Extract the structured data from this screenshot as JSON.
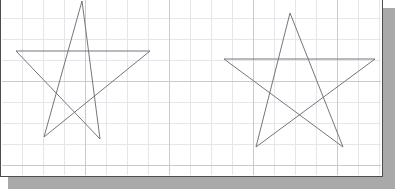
{
  "app": {
    "surface_name": "drawing-canvas",
    "background_color": "#ffffff",
    "frame_border_color": "#4d4d4d",
    "shadow_color": "#a9a9a9",
    "canvas_width": 383,
    "canvas_height": 179
  },
  "grid": {
    "visible": true,
    "minor_spacing_px": 21,
    "major_spacing_px": 84,
    "minor_color": "#e6e6ea",
    "major_color": "#c9c9cf"
  },
  "drawing": {
    "stroke_color": "#75757d",
    "stroke_width": 1,
    "fill": "none",
    "shape_count": 2,
    "shapes": [
      {
        "name": "star-left",
        "type": "pentagram",
        "points": "80,2 98,140 14,52 148,52 42,138"
      },
      {
        "name": "star-right",
        "type": "pentagram",
        "points": "288,14 341,148 222,60 373,60 254,148"
      }
    ]
  }
}
